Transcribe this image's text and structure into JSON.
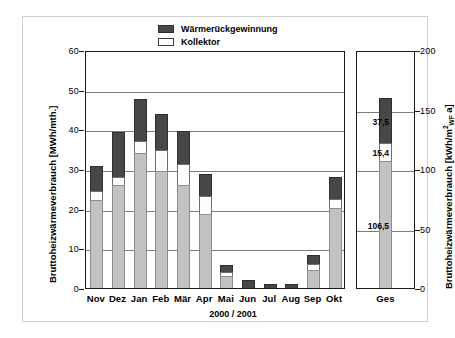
{
  "chart_data": {
    "type": "bar",
    "stacked": true,
    "title": "",
    "xlabel": "2000 / 2001",
    "ylabel": "Bruttoheizwärmeverbrauch [MWh/mth.]",
    "ylabel_right": "Bruttoheizwärmeverbrauch [kWh/m²WF·a]",
    "ylim": [
      0,
      60
    ],
    "yticks": [
      0,
      10,
      20,
      30,
      40,
      50,
      60
    ],
    "ylim_right": [
      0,
      200
    ],
    "yticks_right": [
      0,
      50,
      100,
      150,
      200
    ],
    "grid": true,
    "legend_position": "top-center",
    "categories": [
      "Nov",
      "Dez",
      "Jan",
      "Feb",
      "Mär",
      "Apr",
      "Mai",
      "Jun",
      "Jul",
      "Aug",
      "Sep",
      "Okt"
    ],
    "series": [
      {
        "name": "Gas",
        "color": "#c2c2c2",
        "values": [
          22.3,
          25.9,
          34.1,
          29.6,
          26.0,
          18.6,
          3.0,
          0.0,
          0.0,
          0.0,
          4.6,
          20.2
        ]
      },
      {
        "name": "Kollektor",
        "color": "#ffffff",
        "values": [
          2.2,
          2.0,
          2.9,
          5.1,
          5.3,
          4.7,
          1.1,
          0.0,
          0.0,
          0.0,
          1.4,
          2.3
        ]
      },
      {
        "name": "Wärmerückgewinnung",
        "color": "#474747",
        "values": [
          6.3,
          11.4,
          10.6,
          9.3,
          8.2,
          5.4,
          1.6,
          1.9,
          1.1,
          1.1,
          2.4,
          5.5
        ]
      }
    ],
    "totals_panel": {
      "category": "Ges",
      "axis": "right",
      "unit": "kWh/m²WF·a",
      "segments": [
        {
          "name": "Gas",
          "value": 106.5,
          "label": "106,5",
          "color": "#c2c2c2"
        },
        {
          "name": "Kollektor",
          "value": 15.4,
          "label": "15,4",
          "color": "#ffffff"
        },
        {
          "name": "Wärmerückgewinnung",
          "value": 37.5,
          "label": "37,5",
          "color": "#474747"
        }
      ],
      "total": 159.4
    }
  },
  "legend": {
    "items": [
      {
        "label": "Wärmerückgewinnung",
        "swatch": "dark-gray-swatch"
      },
      {
        "label": "Kollektor",
        "swatch": "white-swatch"
      },
      {
        "label": "Gas",
        "swatch": "light-gray-swatch"
      }
    ]
  },
  "axes": {
    "left_title": "Bruttoheizwärmeverbrauch [MWh/mth.]",
    "left_ticks": [
      "60",
      "50",
      "40",
      "30",
      "20",
      "10",
      "0"
    ],
    "right_title_prefix": "Bruttoheizwärmeverbrauch [kWh/m",
    "right_title_sup": "2",
    "right_title_sub": "WF",
    "right_title_suffix": "a]",
    "right_ticks": [
      "200",
      "150",
      "100",
      "50",
      "0"
    ],
    "x_title": "2000 / 2001",
    "x_labels": [
      "Nov",
      "Dez",
      "Jan",
      "Feb",
      "Mär",
      "Apr",
      "Mai",
      "Jun",
      "Jul",
      "Aug",
      "Sep",
      "Okt"
    ],
    "total_label": "Ges"
  },
  "total_value_labels": [
    "37,5",
    "15,4",
    "106,5"
  ]
}
